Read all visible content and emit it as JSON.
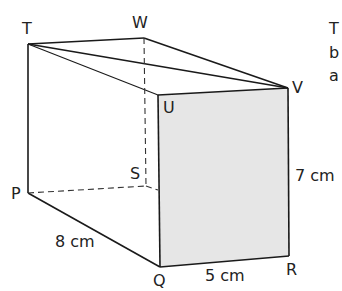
{
  "diagram": {
    "type": "cuboid",
    "vertices": {
      "T": {
        "label": "T"
      },
      "W": {
        "label": "W"
      },
      "V": {
        "label": "V"
      },
      "U": {
        "label": "U"
      },
      "P": {
        "label": "P"
      },
      "S": {
        "label": "S"
      },
      "Q": {
        "label": "Q"
      },
      "R": {
        "label": "R"
      }
    },
    "dimensions": {
      "PQ": "8 cm",
      "QR": "5 cm",
      "RV": "7 cm"
    },
    "shaded_face": "QRVU",
    "diagonals": [
      "TV",
      "TU"
    ],
    "hidden_edges": [
      "WS",
      "PS"
    ]
  },
  "side_text": [
    "T",
    "b",
    "a"
  ],
  "colors": {
    "line": "#1a1a1a",
    "shade": "#e4e4e4"
  }
}
